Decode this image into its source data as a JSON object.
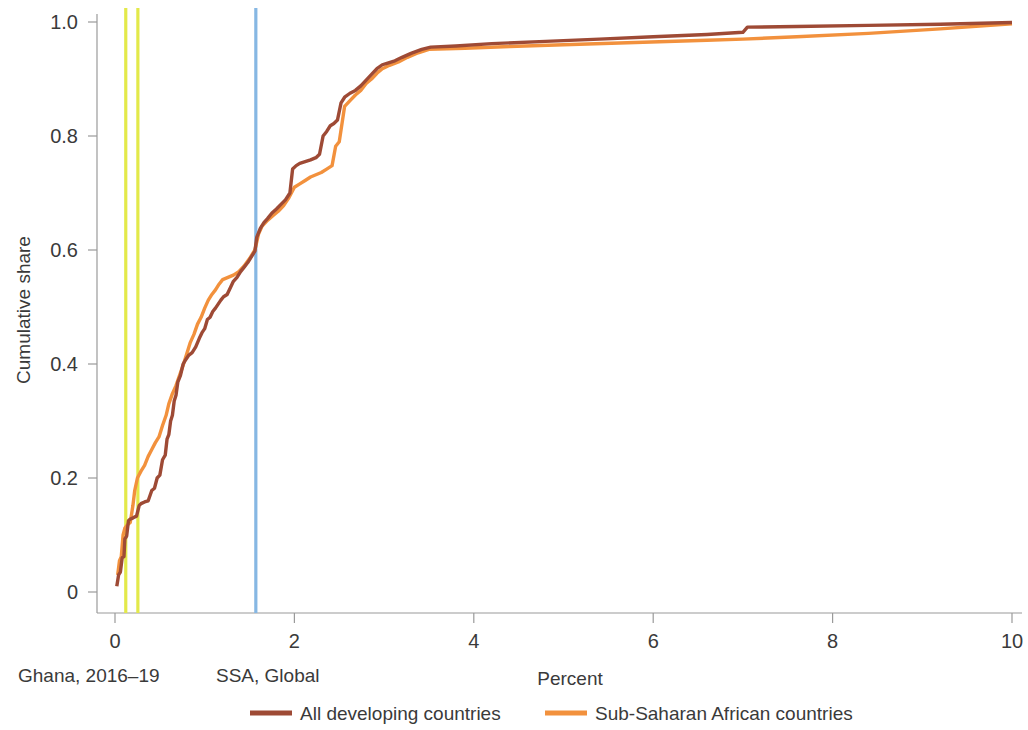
{
  "chart_data": {
    "type": "line",
    "title": "",
    "subtitle": "",
    "xlabel": "Percent",
    "ylabel": "Cumulative share",
    "xlim": [
      -0.25,
      10.1
    ],
    "ylim": [
      -0.04,
      1.045
    ],
    "xticks": [
      0,
      2,
      4,
      6,
      8,
      10
    ],
    "xticklabels": [
      "0",
      "2",
      "4",
      "6",
      "8",
      "10"
    ],
    "yticks": [
      0,
      0.2,
      0.4,
      0.6,
      0.8,
      1.0
    ],
    "yticklabels": [
      "0",
      "0.2",
      "0.4",
      "0.6",
      "0.8",
      "1.0"
    ],
    "grid": false,
    "legend_position": "bottom-center",
    "colors": {
      "all_developing": "#9E4A35",
      "sub_saharan": "#F2913D",
      "ghana_reference": "#E3E94A",
      "ssa_global_reference": "#86B7E3",
      "axis": "#9a9a9a",
      "text": "#3a3a3a"
    },
    "reference_lines": [
      {
        "name": "Ghana 2016",
        "value": 0.12,
        "color": "#E3E94A",
        "group": "Ghana, 2016-19"
      },
      {
        "name": "Ghana 2019",
        "value": 0.255,
        "color": "#E3E94A",
        "group": "Ghana, 2016-19"
      },
      {
        "name": "SSA, Global",
        "value": 1.57,
        "color": "#86B7E3",
        "group": "SSA, Global"
      }
    ],
    "annotations": [
      {
        "text": "Ghana, 2016–19",
        "x_px": 18,
        "y_px": 682
      },
      {
        "text": "SSA, Global",
        "x_px": 216,
        "y_px": 682
      }
    ],
    "series": [
      {
        "name": "All developing countries",
        "color": "#9E4A35",
        "points": [
          [
            0.02,
            0.01
          ],
          [
            0.04,
            0.03
          ],
          [
            0.06,
            0.035
          ],
          [
            0.08,
            0.06
          ],
          [
            0.1,
            0.062
          ],
          [
            0.11,
            0.093
          ],
          [
            0.13,
            0.098
          ],
          [
            0.15,
            0.125
          ],
          [
            0.17,
            0.128
          ],
          [
            0.19,
            0.129
          ],
          [
            0.21,
            0.131
          ],
          [
            0.24,
            0.133
          ],
          [
            0.27,
            0.152
          ],
          [
            0.29,
            0.155
          ],
          [
            0.33,
            0.158
          ],
          [
            0.37,
            0.16
          ],
          [
            0.41,
            0.178
          ],
          [
            0.44,
            0.182
          ],
          [
            0.47,
            0.2
          ],
          [
            0.5,
            0.205
          ],
          [
            0.53,
            0.232
          ],
          [
            0.56,
            0.24
          ],
          [
            0.58,
            0.268
          ],
          [
            0.6,
            0.276
          ],
          [
            0.62,
            0.3
          ],
          [
            0.64,
            0.31
          ],
          [
            0.66,
            0.335
          ],
          [
            0.68,
            0.345
          ],
          [
            0.7,
            0.368
          ],
          [
            0.73,
            0.38
          ],
          [
            0.76,
            0.4
          ],
          [
            0.79,
            0.408
          ],
          [
            0.82,
            0.415
          ],
          [
            0.86,
            0.42
          ],
          [
            0.9,
            0.43
          ],
          [
            0.94,
            0.445
          ],
          [
            0.97,
            0.455
          ],
          [
            1.0,
            0.462
          ],
          [
            1.03,
            0.478
          ],
          [
            1.06,
            0.482
          ],
          [
            1.09,
            0.492
          ],
          [
            1.12,
            0.498
          ],
          [
            1.15,
            0.505
          ],
          [
            1.18,
            0.512
          ],
          [
            1.21,
            0.518
          ],
          [
            1.25,
            0.522
          ],
          [
            1.29,
            0.535
          ],
          [
            1.32,
            0.545
          ],
          [
            1.36,
            0.552
          ],
          [
            1.4,
            0.562
          ],
          [
            1.44,
            0.57
          ],
          [
            1.48,
            0.578
          ],
          [
            1.52,
            0.588
          ],
          [
            1.56,
            0.598
          ],
          [
            1.58,
            0.622
          ],
          [
            1.62,
            0.638
          ],
          [
            1.66,
            0.648
          ],
          [
            1.7,
            0.655
          ],
          [
            1.75,
            0.665
          ],
          [
            1.8,
            0.672
          ],
          [
            1.85,
            0.68
          ],
          [
            1.9,
            0.688
          ],
          [
            1.95,
            0.7
          ],
          [
            1.98,
            0.742
          ],
          [
            2.02,
            0.748
          ],
          [
            2.06,
            0.752
          ],
          [
            2.12,
            0.755
          ],
          [
            2.18,
            0.758
          ],
          [
            2.24,
            0.762
          ],
          [
            2.28,
            0.768
          ],
          [
            2.32,
            0.8
          ],
          [
            2.36,
            0.808
          ],
          [
            2.4,
            0.818
          ],
          [
            2.44,
            0.822
          ],
          [
            2.48,
            0.828
          ],
          [
            2.52,
            0.858
          ],
          [
            2.56,
            0.868
          ],
          [
            2.62,
            0.875
          ],
          [
            2.68,
            0.88
          ],
          [
            2.74,
            0.888
          ],
          [
            2.8,
            0.898
          ],
          [
            2.86,
            0.908
          ],
          [
            2.92,
            0.918
          ],
          [
            2.98,
            0.925
          ],
          [
            3.04,
            0.928
          ],
          [
            3.12,
            0.932
          ],
          [
            3.2,
            0.938
          ],
          [
            3.3,
            0.945
          ],
          [
            3.42,
            0.952
          ],
          [
            3.52,
            0.956
          ],
          [
            3.8,
            0.958
          ],
          [
            4.2,
            0.962
          ],
          [
            4.8,
            0.966
          ],
          [
            5.4,
            0.97
          ],
          [
            6.0,
            0.974
          ],
          [
            6.6,
            0.978
          ],
          [
            7.0,
            0.982
          ],
          [
            7.05,
            0.991
          ],
          [
            7.6,
            0.992
          ],
          [
            8.4,
            0.994
          ],
          [
            9.2,
            0.996
          ],
          [
            10.0,
            0.999
          ]
        ]
      },
      {
        "name": "Sub-Saharan African countries",
        "color": "#F2913D",
        "points": [
          [
            0.03,
            0.03
          ],
          [
            0.05,
            0.055
          ],
          [
            0.07,
            0.062
          ],
          [
            0.09,
            0.1
          ],
          [
            0.11,
            0.112
          ],
          [
            0.14,
            0.118
          ],
          [
            0.17,
            0.122
          ],
          [
            0.2,
            0.152
          ],
          [
            0.22,
            0.178
          ],
          [
            0.25,
            0.2
          ],
          [
            0.29,
            0.212
          ],
          [
            0.33,
            0.222
          ],
          [
            0.37,
            0.238
          ],
          [
            0.41,
            0.25
          ],
          [
            0.45,
            0.262
          ],
          [
            0.49,
            0.272
          ],
          [
            0.53,
            0.292
          ],
          [
            0.57,
            0.31
          ],
          [
            0.6,
            0.33
          ],
          [
            0.64,
            0.348
          ],
          [
            0.68,
            0.362
          ],
          [
            0.72,
            0.38
          ],
          [
            0.76,
            0.398
          ],
          [
            0.8,
            0.418
          ],
          [
            0.84,
            0.438
          ],
          [
            0.88,
            0.452
          ],
          [
            0.92,
            0.47
          ],
          [
            0.96,
            0.482
          ],
          [
            1.0,
            0.498
          ],
          [
            1.04,
            0.512
          ],
          [
            1.08,
            0.522
          ],
          [
            1.12,
            0.53
          ],
          [
            1.16,
            0.54
          ],
          [
            1.2,
            0.548
          ],
          [
            1.26,
            0.552
          ],
          [
            1.32,
            0.556
          ],
          [
            1.38,
            0.562
          ],
          [
            1.44,
            0.572
          ],
          [
            1.5,
            0.585
          ],
          [
            1.56,
            0.6
          ],
          [
            1.6,
            0.628
          ],
          [
            1.64,
            0.642
          ],
          [
            1.7,
            0.652
          ],
          [
            1.76,
            0.66
          ],
          [
            1.82,
            0.668
          ],
          [
            1.88,
            0.678
          ],
          [
            1.94,
            0.692
          ],
          [
            2.0,
            0.71
          ],
          [
            2.06,
            0.716
          ],
          [
            2.12,
            0.722
          ],
          [
            2.18,
            0.728
          ],
          [
            2.24,
            0.732
          ],
          [
            2.3,
            0.736
          ],
          [
            2.36,
            0.742
          ],
          [
            2.42,
            0.748
          ],
          [
            2.46,
            0.782
          ],
          [
            2.5,
            0.79
          ],
          [
            2.56,
            0.852
          ],
          [
            2.62,
            0.862
          ],
          [
            2.68,
            0.872
          ],
          [
            2.74,
            0.88
          ],
          [
            2.8,
            0.892
          ],
          [
            2.86,
            0.9
          ],
          [
            2.92,
            0.91
          ],
          [
            2.98,
            0.918
          ],
          [
            3.06,
            0.924
          ],
          [
            3.16,
            0.93
          ],
          [
            3.26,
            0.938
          ],
          [
            3.38,
            0.946
          ],
          [
            3.5,
            0.952
          ],
          [
            3.9,
            0.954
          ],
          [
            4.4,
            0.957
          ],
          [
            5.0,
            0.96
          ],
          [
            5.8,
            0.964
          ],
          [
            6.6,
            0.968
          ],
          [
            7.0,
            0.97
          ],
          [
            7.6,
            0.974
          ],
          [
            8.4,
            0.98
          ],
          [
            9.2,
            0.988
          ],
          [
            10.0,
            0.997
          ]
        ]
      }
    ],
    "legend": [
      {
        "label": "All developing countries",
        "color": "#9E4A35"
      },
      {
        "label": "Sub-Saharan African countries",
        "color": "#F2913D"
      }
    ]
  }
}
